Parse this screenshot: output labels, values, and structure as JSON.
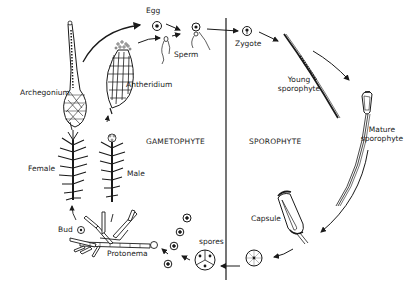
{
  "diagram": {
    "phases": {
      "left": "GAMETOPHYTE",
      "right": "SPOROPHYTE"
    },
    "labels": {
      "egg": "Egg",
      "sperm": "Sperm",
      "zygote": "Zygote",
      "archegonium": "Archegonium",
      "antheridium": "Antheridium",
      "young_sporophyte_1": "Young",
      "young_sporophyte_2": "sporophyte",
      "mature_sporophyte_1": "Mature",
      "mature_sporophyte_2": "sporophyte",
      "female": "Female",
      "male": "Male",
      "capsule": "Capsule",
      "bud": "Bud",
      "protonema": "Protonema",
      "spores": "spores"
    },
    "colors": {
      "ink": "#1a1a1a",
      "background": "#ffffff"
    }
  }
}
